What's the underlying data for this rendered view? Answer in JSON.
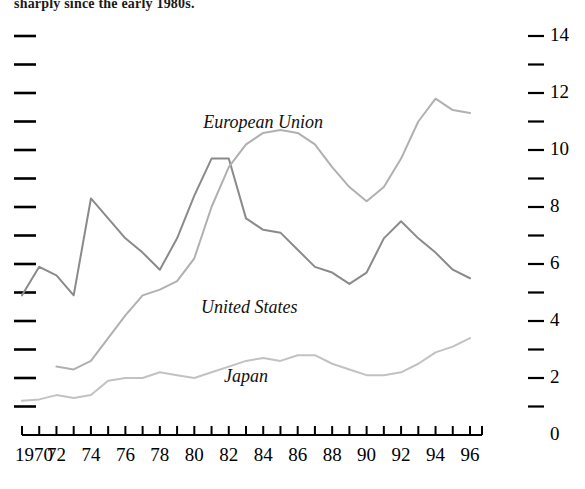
{
  "caption": {
    "text": "sharply since the early 1980s."
  },
  "chart_data": {
    "type": "line",
    "title": "",
    "subtitle": "",
    "xlabel": "",
    "ylabel": "",
    "xlim": [
      1970,
      1996
    ],
    "ylim": [
      0,
      14
    ],
    "grid": false,
    "legend_position": "inline-annotations",
    "y_axis_side": "right",
    "y_ticks_major": [
      0,
      2,
      4,
      6,
      8,
      10,
      12,
      14
    ],
    "y_ticks_minor": [
      1,
      3,
      5,
      7,
      9,
      11,
      13
    ],
    "y_tick_labels": [
      "0",
      "2",
      "4",
      "6",
      "8",
      "10",
      "12",
      "14"
    ],
    "x_ticks": [
      1970,
      1971,
      1972,
      1973,
      1974,
      1975,
      1976,
      1977,
      1978,
      1979,
      1980,
      1981,
      1982,
      1983,
      1984,
      1985,
      1986,
      1987,
      1988,
      1989,
      1990,
      1991,
      1992,
      1993,
      1994,
      1995,
      1996
    ],
    "x_tick_labels_shown": [
      "1970",
      "72",
      "74",
      "76",
      "78",
      "80",
      "82",
      "84",
      "86",
      "88",
      "90",
      "92",
      "94",
      "96"
    ],
    "x_tick_label_years": [
      1970,
      1972,
      1974,
      1976,
      1978,
      1980,
      1982,
      1984,
      1986,
      1988,
      1990,
      1992,
      1994,
      1996
    ],
    "x": [
      1970,
      1971,
      1972,
      1973,
      1974,
      1975,
      1976,
      1977,
      1978,
      1979,
      1980,
      1981,
      1982,
      1983,
      1984,
      1985,
      1986,
      1987,
      1988,
      1989,
      1990,
      1991,
      1992,
      1993,
      1994,
      1995,
      1996
    ],
    "series": [
      {
        "name": "United States",
        "color": "#8a8a8a",
        "label_x": 1983.2,
        "label_y": 4.45,
        "x": [
          1970,
          1971,
          1972,
          1973,
          1974,
          1975,
          1976,
          1977,
          1978,
          1979,
          1980,
          1981,
          1982,
          1983,
          1984,
          1985,
          1986,
          1987,
          1988,
          1989,
          1990,
          1991,
          1992,
          1993,
          1994,
          1995,
          1996
        ],
        "values": [
          4.9,
          5.9,
          5.6,
          4.9,
          8.3,
          7.6,
          6.9,
          6.4,
          5.8,
          6.9,
          8.4,
          9.7,
          9.7,
          7.6,
          7.2,
          7.1,
          6.5,
          5.9,
          5.7,
          5.3,
          5.7,
          6.9,
          7.5,
          6.9,
          6.4,
          5.8,
          5.5
        ],
        "annotations": [
          {
            "label": "peak",
            "x": 1982,
            "y": 9.7
          },
          {
            "label": "trough",
            "x": 1989,
            "y": 5.3
          }
        ]
      },
      {
        "name": "European Union",
        "color": "#b0b0b0",
        "label_x": 1984.0,
        "label_y": 10.95,
        "x": [
          1972,
          1973,
          1974,
          1975,
          1976,
          1977,
          1978,
          1979,
          1980,
          1981,
          1982,
          1983,
          1984,
          1985,
          1986,
          1987,
          1988,
          1989,
          1990,
          1991,
          1992,
          1993,
          1994,
          1995,
          1996
        ],
        "values": [
          2.4,
          2.3,
          2.6,
          3.4,
          4.2,
          4.9,
          5.1,
          5.4,
          6.2,
          8.0,
          9.4,
          10.2,
          10.6,
          10.7,
          10.6,
          10.2,
          9.4,
          8.7,
          8.2,
          8.7,
          9.7,
          11.0,
          11.8,
          11.4,
          11.3
        ],
        "annotations": [
          {
            "label": "trough",
            "x": 1990,
            "y": 8.2
          },
          {
            "label": "peak",
            "x": 1994,
            "y": 11.8
          }
        ]
      },
      {
        "name": "Japan",
        "color": "#c2c2c2",
        "label_x": 1983.0,
        "label_y": 2.05,
        "x": [
          1970,
          1971,
          1972,
          1973,
          1974,
          1975,
          1976,
          1977,
          1978,
          1979,
          1980,
          1981,
          1982,
          1983,
          1984,
          1985,
          1986,
          1987,
          1988,
          1989,
          1990,
          1991,
          1992,
          1993,
          1994,
          1995,
          1996
        ],
        "values": [
          1.2,
          1.25,
          1.4,
          1.3,
          1.4,
          1.9,
          2.0,
          2.0,
          2.2,
          2.1,
          2.0,
          2.2,
          2.4,
          2.6,
          2.7,
          2.6,
          2.8,
          2.8,
          2.5,
          2.3,
          2.1,
          2.1,
          2.2,
          2.5,
          2.9,
          3.1,
          3.4
        ]
      }
    ]
  },
  "annotations": {
    "european_union_label": "European Union",
    "united_states_label": "United States",
    "japan_label": "Japan"
  }
}
